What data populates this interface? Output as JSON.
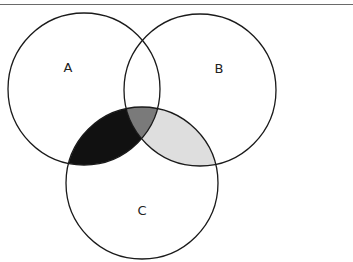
{
  "diagram": {
    "type": "venn",
    "sets": [
      {
        "label": "A",
        "cx": 84,
        "cy": 89,
        "r": 76
      },
      {
        "label": "B",
        "cx": 200,
        "cy": 90,
        "r": 76
      },
      {
        "label": "C",
        "cx": 142,
        "cy": 183,
        "r": 76
      }
    ],
    "shaded_regions": [
      {
        "region": "A∩C only",
        "color": "#111111"
      },
      {
        "region": "A∩B∩C",
        "color": "#7a7a7a"
      },
      {
        "region": "B∩C only",
        "color": "#dedede"
      }
    ],
    "stroke_color": "#1a1a1a"
  }
}
